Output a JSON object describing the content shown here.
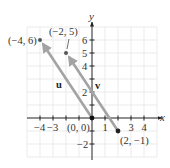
{
  "figure": {
    "x_axis_label": "x",
    "y_axis_label": "y",
    "x_ticks": [
      {
        "value": -4,
        "label": "−4"
      },
      {
        "value": -3,
        "label": "−3"
      },
      {
        "value": 1,
        "label": "1"
      },
      {
        "value": 3,
        "label": "3"
      },
      {
        "value": 4,
        "label": "4"
      }
    ],
    "y_ticks": [
      {
        "value": 6,
        "label": "6"
      },
      {
        "value": 5,
        "label": "5"
      },
      {
        "value": 4,
        "label": "4"
      },
      {
        "value": 2,
        "label": "2"
      },
      {
        "value": -2,
        "label": "−2"
      }
    ],
    "points": [
      {
        "label": "(−4, 6)",
        "x": -4,
        "y": 6
      },
      {
        "label": "(−2, 5)",
        "x": -2,
        "y": 5
      },
      {
        "label": "(0, 0)",
        "x": 0,
        "y": 0
      },
      {
        "label": "(2, −1)",
        "x": 2,
        "y": -1
      }
    ],
    "vectors": [
      {
        "name": "u",
        "from": [
          0,
          0
        ],
        "to": [
          -4,
          6
        ]
      },
      {
        "name": "v",
        "from": [
          2,
          -1
        ],
        "to": [
          -2,
          5
        ]
      }
    ],
    "grid_range": {
      "x": [
        -5,
        5
      ],
      "y": [
        -3,
        7
      ]
    },
    "colors": {
      "vector": "#a3a3a3",
      "axis": "#222222",
      "grid": "#e6e6e6",
      "point": "#555555"
    }
  }
}
